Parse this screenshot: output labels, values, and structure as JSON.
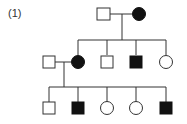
{
  "figure": {
    "label": "(1)",
    "type": "pedigree",
    "colors": {
      "stroke": "#333333",
      "affected_fill": "#111111",
      "unaffected_fill": "#ffffff"
    },
    "generations": [
      {
        "gen": "I",
        "members": [
          {
            "id": "I-1",
            "sex": "male",
            "affected": false
          },
          {
            "id": "I-2",
            "sex": "female",
            "affected": true
          }
        ]
      },
      {
        "gen": "II",
        "members": [
          {
            "id": "II-spouse",
            "sex": "male",
            "affected": false
          },
          {
            "id": "II-1",
            "sex": "female",
            "affected": true
          },
          {
            "id": "II-2",
            "sex": "male",
            "affected": false
          },
          {
            "id": "II-3",
            "sex": "male",
            "affected": true
          },
          {
            "id": "II-4",
            "sex": "female",
            "affected": false
          }
        ]
      },
      {
        "gen": "III",
        "members": [
          {
            "id": "III-1",
            "sex": "male",
            "affected": false
          },
          {
            "id": "III-2",
            "sex": "male",
            "affected": true
          },
          {
            "id": "III-3",
            "sex": "female",
            "affected": false
          },
          {
            "id": "III-4",
            "sex": "female",
            "affected": false
          },
          {
            "id": "III-5",
            "sex": "male",
            "affected": true
          }
        ]
      }
    ]
  }
}
